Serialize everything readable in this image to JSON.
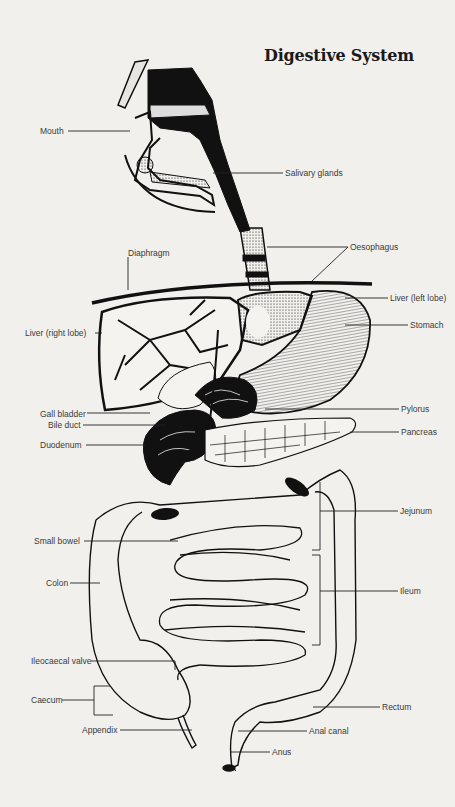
{
  "diagram": {
    "title": "Digestive System",
    "background_color": "#f1f0ed",
    "ink_color": "#111111",
    "labels_left": [
      {
        "id": "mouth",
        "text": "Mouth"
      },
      {
        "id": "diaphragm",
        "text": "Diaphragm"
      },
      {
        "id": "liver-right-lobe",
        "text": "Liver (right lobe)"
      },
      {
        "id": "gall-bladder",
        "text": "Gall bladder"
      },
      {
        "id": "bile-duct",
        "text": "Bile duct"
      },
      {
        "id": "duodenum",
        "text": "Duodenum"
      },
      {
        "id": "small-bowel",
        "text": "Small bowel"
      },
      {
        "id": "colon",
        "text": "Colon"
      },
      {
        "id": "ileocaecal-valve",
        "text": "Ileocaecal valve"
      },
      {
        "id": "caecum",
        "text": "Caecum"
      },
      {
        "id": "appendix",
        "text": "Appendix"
      }
    ],
    "labels_right": [
      {
        "id": "salivary-glands",
        "text": "Salivary glands"
      },
      {
        "id": "oesophagus",
        "text": "Oesophagus"
      },
      {
        "id": "liver-left-lobe",
        "text": "Liver (left lobe)"
      },
      {
        "id": "stomach",
        "text": "Stomach"
      },
      {
        "id": "pylorus",
        "text": "Pylorus"
      },
      {
        "id": "pancreas",
        "text": "Pancreas"
      },
      {
        "id": "jejunum",
        "text": "Jejunum"
      },
      {
        "id": "ileum",
        "text": "Ileum"
      },
      {
        "id": "rectum",
        "text": "Rectum"
      },
      {
        "id": "anal-canal",
        "text": "Anal canal"
      },
      {
        "id": "anus",
        "text": "Anus"
      }
    ]
  }
}
